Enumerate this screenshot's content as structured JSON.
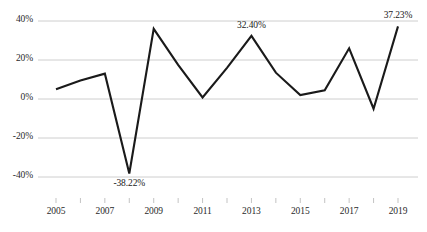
{
  "chart_data": {
    "type": "line",
    "title": "",
    "subtitle": "",
    "xlabel": "",
    "ylabel": "",
    "grid": true,
    "legend": false,
    "legend_position": "none",
    "line_color": "#1a1a1a",
    "gridline_color": "#c8c8c8",
    "ylim": [
      -40,
      40
    ],
    "xlim": [
      2005,
      2019
    ],
    "y_ticks": [
      40,
      20,
      0,
      -20,
      -40
    ],
    "y_tick_labels": [
      "40%",
      "20%",
      "0%",
      "-20%",
      "-40%"
    ],
    "x_ticks": [
      2005,
      2006,
      2007,
      2008,
      2009,
      2010,
      2011,
      2012,
      2013,
      2014,
      2015,
      2016,
      2017,
      2018,
      2019
    ],
    "x_tick_labels": [
      "2005",
      "",
      "2007",
      "",
      "2009",
      "",
      "2011",
      "",
      "2013",
      "",
      "2015",
      "",
      "2017",
      "",
      "2019"
    ],
    "x_visible_labels": [
      "2005",
      "2007",
      "2009",
      "2011",
      "2013",
      "2015",
      "2017",
      "2019"
    ],
    "x": [
      2005,
      2006,
      2007,
      2008,
      2009,
      2010,
      2011,
      2012,
      2013,
      2014,
      2015,
      2016,
      2017,
      2018,
      2019
    ],
    "values": [
      5.0,
      9.5,
      13.0,
      -38.22,
      36.0,
      17.5,
      0.8,
      16.0,
      32.4,
      13.5,
      2.0,
      4.5,
      26.0,
      -5.0,
      37.23
    ],
    "point_labels": [
      {
        "x": 2008,
        "value": -38.22,
        "text": "-38.22%",
        "position": "below"
      },
      {
        "x": 2013,
        "value": 32.4,
        "text": "32.40%",
        "position": "above"
      },
      {
        "x": 2019,
        "value": 37.23,
        "text": "37.23%",
        "position": "above"
      }
    ]
  }
}
